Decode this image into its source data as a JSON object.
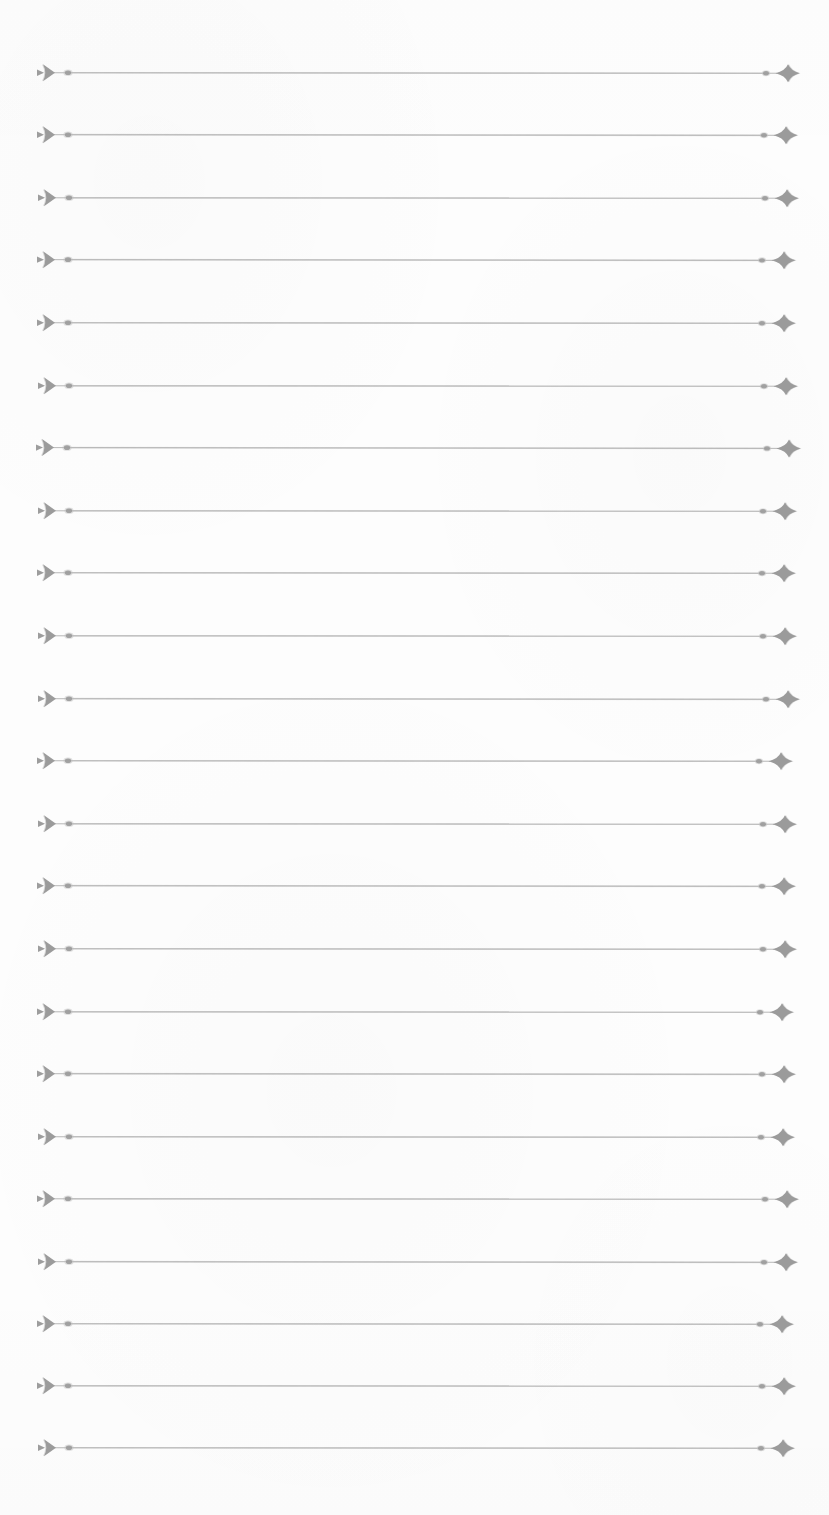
{
  "document": {
    "title": "Ruled Practice Sheet",
    "media": "scanned paper",
    "page_width": 829,
    "page_height": 1515,
    "background_color": "#fdfdfd",
    "ink_color": "#989898",
    "line_color": "#a8a8a8"
  },
  "ruling": {
    "line_count": 23,
    "first_line_y": 73,
    "line_spacing": 62.5,
    "line_start_x": 42,
    "line_end_x": 788,
    "left_marker": "right-pointing-arrowhead",
    "right_marker": "four-pointed-star",
    "left_dot_offset_x": 26,
    "right_dot_offset_x": 22,
    "marker_half_height": 9
  },
  "lines": [
    {
      "index": 1,
      "y": 73,
      "tilt": 0.5,
      "start_x": 42,
      "end_x": 788
    },
    {
      "index": 2,
      "y": 135,
      "tilt": 0.6,
      "start_x": 42,
      "end_x": 786
    },
    {
      "index": 3,
      "y": 198,
      "tilt": 0.4,
      "start_x": 43,
      "end_x": 787
    },
    {
      "index": 4,
      "y": 260,
      "tilt": 0.7,
      "start_x": 42,
      "end_x": 784
    },
    {
      "index": 5,
      "y": 323,
      "tilt": 0.5,
      "start_x": 42,
      "end_x": 784
    },
    {
      "index": 6,
      "y": 386,
      "tilt": 0.4,
      "start_x": 43,
      "end_x": 786
    },
    {
      "index": 7,
      "y": 448,
      "tilt": 0.8,
      "start_x": 41,
      "end_x": 789
    },
    {
      "index": 8,
      "y": 511,
      "tilt": 0.4,
      "start_x": 43,
      "end_x": 785
    },
    {
      "index": 9,
      "y": 573,
      "tilt": 0.5,
      "start_x": 42,
      "end_x": 784
    },
    {
      "index": 10,
      "y": 636,
      "tilt": 0.4,
      "start_x": 43,
      "end_x": 785
    },
    {
      "index": 11,
      "y": 699,
      "tilt": 0.6,
      "start_x": 43,
      "end_x": 788
    },
    {
      "index": 12,
      "y": 761,
      "tilt": 0.5,
      "start_x": 42,
      "end_x": 781
    },
    {
      "index": 13,
      "y": 824,
      "tilt": 0.4,
      "start_x": 43,
      "end_x": 785
    },
    {
      "index": 14,
      "y": 886,
      "tilt": 0.6,
      "start_x": 42,
      "end_x": 784
    },
    {
      "index": 15,
      "y": 949,
      "tilt": 0.5,
      "start_x": 43,
      "end_x": 785
    },
    {
      "index": 16,
      "y": 1012,
      "tilt": 0.4,
      "start_x": 42,
      "end_x": 782
    },
    {
      "index": 17,
      "y": 1074,
      "tilt": 0.6,
      "start_x": 42,
      "end_x": 784
    },
    {
      "index": 18,
      "y": 1137,
      "tilt": 0.5,
      "start_x": 43,
      "end_x": 783
    },
    {
      "index": 19,
      "y": 1199,
      "tilt": 0.4,
      "start_x": 42,
      "end_x": 787
    },
    {
      "index": 20,
      "y": 1262,
      "tilt": 0.6,
      "start_x": 43,
      "end_x": 786
    },
    {
      "index": 21,
      "y": 1324,
      "tilt": 0.5,
      "start_x": 42,
      "end_x": 782
    },
    {
      "index": 22,
      "y": 1386,
      "tilt": 0.4,
      "start_x": 42,
      "end_x": 784
    },
    {
      "index": 23,
      "y": 1448,
      "tilt": 0.5,
      "start_x": 43,
      "end_x": 783
    }
  ]
}
